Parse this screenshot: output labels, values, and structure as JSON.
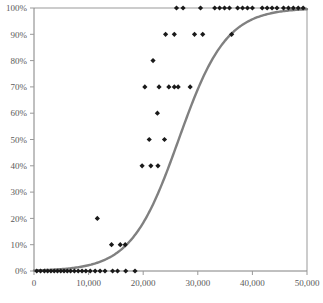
{
  "chart_data": {
    "type": "scatter",
    "title": "",
    "subtitle": "",
    "xlabel": "",
    "ylabel": "",
    "xlim": [
      0,
      50000
    ],
    "ylim": [
      0,
      1
    ],
    "grid": false,
    "legend": null,
    "x_tick_labels": [
      "0",
      "10,000",
      "20,000",
      "30,000",
      "40,000",
      "50,000"
    ],
    "x_tick_values": [
      0,
      10000,
      20000,
      30000,
      40000,
      50000
    ],
    "y_tick_labels": [
      "0%",
      "10%",
      "20%",
      "30%",
      "40%",
      "50%",
      "60%",
      "70%",
      "80%",
      "90%",
      "100%"
    ],
    "y_tick_values": [
      0,
      0.1,
      0.2,
      0.3,
      0.4,
      0.5,
      0.6,
      0.7,
      0.8,
      0.9,
      1.0
    ],
    "marker_color": "#1a1a1a",
    "marker_shape": "diamond",
    "line_color": "#808080",
    "axis_color": "#999999",
    "series": [
      {
        "name": "observations",
        "type": "scatter",
        "points": [
          [
            500,
            0.0
          ],
          [
            1200,
            0.0
          ],
          [
            1900,
            0.0
          ],
          [
            2500,
            0.0
          ],
          [
            3100,
            0.0
          ],
          [
            3700,
            0.0
          ],
          [
            4300,
            0.0
          ],
          [
            4900,
            0.0
          ],
          [
            5500,
            0.0
          ],
          [
            6100,
            0.0
          ],
          [
            6700,
            0.0
          ],
          [
            7400,
            0.0
          ],
          [
            8100,
            0.0
          ],
          [
            8800,
            0.0
          ],
          [
            9500,
            0.0
          ],
          [
            10300,
            0.0
          ],
          [
            11200,
            0.0
          ],
          [
            12100,
            0.0
          ],
          [
            13000,
            0.0
          ],
          [
            14400,
            0.0
          ],
          [
            15300,
            0.0
          ],
          [
            16800,
            0.0
          ],
          [
            18500,
            0.0
          ],
          [
            11600,
            0.2
          ],
          [
            14200,
            0.1
          ],
          [
            15800,
            0.1
          ],
          [
            16700,
            0.1
          ],
          [
            19800,
            0.4
          ],
          [
            21400,
            0.4
          ],
          [
            22700,
            0.4
          ],
          [
            21100,
            0.5
          ],
          [
            23900,
            0.5
          ],
          [
            22600,
            0.6
          ],
          [
            20300,
            0.7
          ],
          [
            22900,
            0.7
          ],
          [
            24700,
            0.7
          ],
          [
            25700,
            0.7
          ],
          [
            26400,
            0.7
          ],
          [
            28600,
            0.7
          ],
          [
            21800,
            0.8
          ],
          [
            24100,
            0.9
          ],
          [
            25700,
            0.9
          ],
          [
            29400,
            0.9
          ],
          [
            30900,
            0.9
          ],
          [
            36200,
            0.9
          ],
          [
            26100,
            1.0
          ],
          [
            27300,
            1.0
          ],
          [
            30500,
            1.0
          ],
          [
            33100,
            1.0
          ],
          [
            34000,
            1.0
          ],
          [
            34900,
            1.0
          ],
          [
            35800,
            1.0
          ],
          [
            37300,
            1.0
          ],
          [
            38200,
            1.0
          ],
          [
            39100,
            1.0
          ],
          [
            40000,
            1.0
          ],
          [
            41800,
            1.0
          ],
          [
            42700,
            1.0
          ],
          [
            43600,
            1.0
          ],
          [
            44500,
            1.0
          ],
          [
            45700,
            1.0
          ],
          [
            46600,
            1.0
          ],
          [
            47500,
            1.0
          ],
          [
            48400,
            1.0
          ],
          [
            49300,
            1.0
          ]
        ]
      },
      {
        "name": "fitted-logistic-curve",
        "type": "line",
        "midpoint": 26500,
        "steepness": 0.00023,
        "points": [
          [
            0,
            0.002
          ],
          [
            2000,
            0.003
          ],
          [
            4000,
            0.005
          ],
          [
            6000,
            0.009
          ],
          [
            8000,
            0.014
          ],
          [
            10000,
            0.022
          ],
          [
            12000,
            0.035
          ],
          [
            14000,
            0.055
          ],
          [
            16000,
            0.085
          ],
          [
            18000,
            0.128
          ],
          [
            20000,
            0.19
          ],
          [
            22000,
            0.272
          ],
          [
            24000,
            0.372
          ],
          [
            26000,
            0.482
          ],
          [
            28000,
            0.592
          ],
          [
            30000,
            0.691
          ],
          [
            32000,
            0.774
          ],
          [
            34000,
            0.839
          ],
          [
            36000,
            0.887
          ],
          [
            38000,
            0.921
          ],
          [
            40000,
            0.946
          ],
          [
            42000,
            0.963
          ],
          [
            44000,
            0.975
          ],
          [
            46000,
            0.983
          ],
          [
            48000,
            0.989
          ],
          [
            50000,
            0.993
          ]
        ]
      }
    ]
  },
  "plot": {
    "left_px": 34,
    "right_px": 307,
    "top_px": 8,
    "bottom_px": 271
  }
}
